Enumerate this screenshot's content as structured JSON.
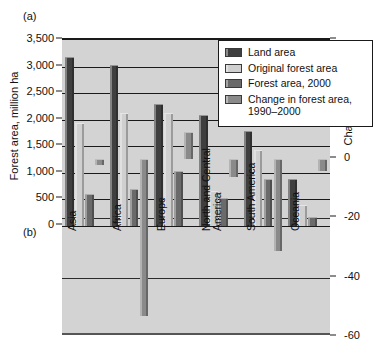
{
  "panels": {
    "a": "(a)",
    "b": "(b)"
  },
  "axes": {
    "left": {
      "title": "Forest area, million ha",
      "ticks": [
        "3,500",
        "3,000",
        "2,500",
        "2,000",
        "1,500",
        "1,000",
        "500",
        "0"
      ],
      "values": [
        3500,
        3000,
        2500,
        2000,
        1500,
        1000,
        500,
        0
      ],
      "min": 0,
      "max": 3500
    },
    "right": {
      "title": "Change, million ha",
      "ticks": [
        "20",
        "0",
        "-20",
        "-40",
        "-60"
      ],
      "values": [
        20,
        0,
        -20,
        -40,
        -60
      ],
      "min": -60,
      "max": 40
    }
  },
  "legend": {
    "items": [
      {
        "label": "Land area",
        "color": "#3f3f3f"
      },
      {
        "label": "Original forest area",
        "color": "#cfcfcf"
      },
      {
        "label": "Forest area, 2000",
        "color": "#6a6a6a"
      },
      {
        "label": "Change in forest area, 1990–2000",
        "color": "#8a8a8a"
      }
    ]
  },
  "chart_data": {
    "type": "bar",
    "title": "",
    "xlabel": "",
    "ylabel": "Forest area, million ha",
    "ylabel_secondary": "Change, million ha",
    "ylim": [
      0,
      3500
    ],
    "ylim_secondary": [
      -60,
      40
    ],
    "grid": true,
    "legend_position": "top-right",
    "categories": [
      "Asia",
      "Africa",
      "Europe",
      "North and Central America",
      "South America",
      "Oceania"
    ],
    "series": [
      {
        "name": "Land area",
        "axis": "left",
        "color": "#3f3f3f",
        "values": [
          3180,
          3030,
          2300,
          2090,
          1780,
          890
        ]
      },
      {
        "name": "Original forest area",
        "axis": "left",
        "color": "#cfcfcf",
        "values": [
          1930,
          2120,
          2120,
          660,
          1430,
          390
        ]
      },
      {
        "name": "Forest area, 2000",
        "axis": "left",
        "color": "#6a6a6a",
        "values": [
          600,
          700,
          1030,
          530,
          880,
          160
        ]
      },
      {
        "name": "Change in forest area, 1990–2000",
        "axis": "right",
        "color": "#8a8a8a",
        "values": [
          -2,
          -53,
          9,
          -6,
          -31,
          -4
        ]
      }
    ]
  }
}
